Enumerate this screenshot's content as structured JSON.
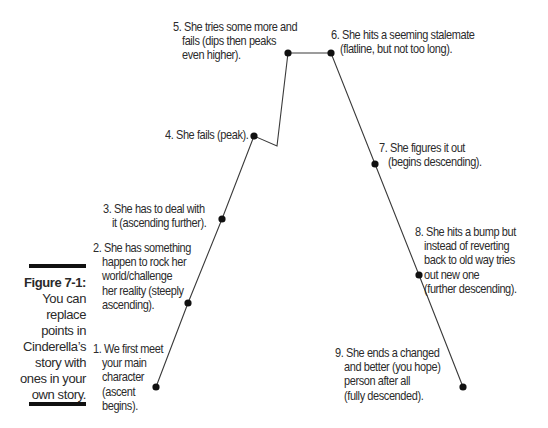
{
  "figure": {
    "number_label": "Figure 7-1:",
    "caption_lines": [
      "You can",
      "replace",
      "points in",
      "Cinderella’s",
      "story with",
      "ones in your",
      "own story."
    ]
  },
  "story_arc": {
    "title": "Cinderella story arc",
    "points": [
      {
        "id": 1,
        "lines": [
          "1. We first meet",
          "your main",
          "character",
          "(ascent",
          "begins)."
        ]
      },
      {
        "id": 2,
        "lines": [
          "2. She has something",
          "happen to rock her",
          "world/challenge",
          "her reality (steeply",
          "ascending)."
        ]
      },
      {
        "id": 3,
        "lines": [
          "3. She has to deal with",
          "it (ascending further)."
        ]
      },
      {
        "id": 4,
        "lines": [
          "4. She fails (peak)."
        ]
      },
      {
        "id": 5,
        "lines": [
          "5. She tries some more and",
          "fails (dips then peaks",
          "even higher)."
        ]
      },
      {
        "id": 6,
        "lines": [
          "6. She hits a seeming stalemate",
          "(flatline, but not too long)."
        ]
      },
      {
        "id": 7,
        "lines": [
          "7. She figures it out",
          "(begins descending)."
        ]
      },
      {
        "id": 8,
        "lines": [
          "8. She hits a bump but",
          "instead of reverting",
          "back to old way tries",
          "out new one",
          "(further descending)."
        ]
      },
      {
        "id": 9,
        "lines": [
          "9. She ends a changed",
          "and better (you hope)",
          "person after all",
          "(fully descended)."
        ]
      }
    ]
  },
  "colors": {
    "line": "#3a3a3a",
    "dot": "#111111",
    "rule": "#111111"
  }
}
